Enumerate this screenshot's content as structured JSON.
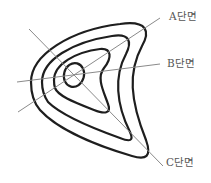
{
  "diagram": {
    "type": "contour-map-with-cross-sections",
    "contour_count": 4,
    "sections": [
      {
        "id": "A",
        "label": "A단면"
      },
      {
        "id": "B",
        "label": "B단면"
      },
      {
        "id": "C",
        "label": "C단면"
      }
    ],
    "colors": {
      "contour": "#1e1e1e",
      "section_line": "#8a8a8a",
      "label": "#555555",
      "background": "#ffffff"
    }
  }
}
